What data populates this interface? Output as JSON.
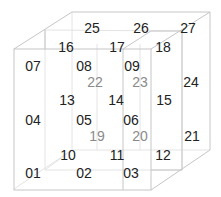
{
  "diagram": {
    "title": "",
    "type": "3x3x3 numbered cube",
    "colors": {
      "line": "#c8c8c8",
      "inner_line": "#e2e2e2",
      "front_text": "#222222",
      "hidden_text": "#8a8a8a",
      "background": "#ffffff"
    },
    "labels": [
      {
        "text": "25",
        "x": 92,
        "y": 28,
        "tone": "dark"
      },
      {
        "text": "26",
        "x": 141,
        "y": 28,
        "tone": "dark"
      },
      {
        "text": "27",
        "x": 188,
        "y": 28,
        "tone": "dark"
      },
      {
        "text": "16",
        "x": 66,
        "y": 47,
        "tone": "dark"
      },
      {
        "text": "17",
        "x": 117,
        "y": 47,
        "tone": "dark"
      },
      {
        "text": "18",
        "x": 163,
        "y": 47,
        "tone": "dark"
      },
      {
        "text": "07",
        "x": 33,
        "y": 66,
        "tone": "dark"
      },
      {
        "text": "08",
        "x": 84,
        "y": 66,
        "tone": "dark"
      },
      {
        "text": "09",
        "x": 132,
        "y": 66,
        "tone": "dark"
      },
      {
        "text": "22",
        "x": 95,
        "y": 82,
        "tone": "grey"
      },
      {
        "text": "23",
        "x": 140,
        "y": 82,
        "tone": "grey"
      },
      {
        "text": "24",
        "x": 191,
        "y": 82,
        "tone": "dark"
      },
      {
        "text": "13",
        "x": 67,
        "y": 100,
        "tone": "dark"
      },
      {
        "text": "14",
        "x": 116,
        "y": 100,
        "tone": "dark"
      },
      {
        "text": "15",
        "x": 164,
        "y": 100,
        "tone": "dark"
      },
      {
        "text": "04",
        "x": 33,
        "y": 120,
        "tone": "dark"
      },
      {
        "text": "05",
        "x": 84,
        "y": 120,
        "tone": "dark"
      },
      {
        "text": "06",
        "x": 131,
        "y": 120,
        "tone": "dark"
      },
      {
        "text": "19",
        "x": 97,
        "y": 136,
        "tone": "grey"
      },
      {
        "text": "20",
        "x": 140,
        "y": 136,
        "tone": "grey"
      },
      {
        "text": "21",
        "x": 192,
        "y": 136,
        "tone": "dark"
      },
      {
        "text": "10",
        "x": 68,
        "y": 155,
        "tone": "dark"
      },
      {
        "text": "11",
        "x": 117,
        "y": 155,
        "tone": "dark"
      },
      {
        "text": "12",
        "x": 163,
        "y": 155,
        "tone": "dark"
      },
      {
        "text": "01",
        "x": 33,
        "y": 173,
        "tone": "dark"
      },
      {
        "text": "02",
        "x": 84,
        "y": 173,
        "tone": "dark"
      },
      {
        "text": "03",
        "x": 131,
        "y": 173,
        "tone": "dark"
      }
    ]
  }
}
